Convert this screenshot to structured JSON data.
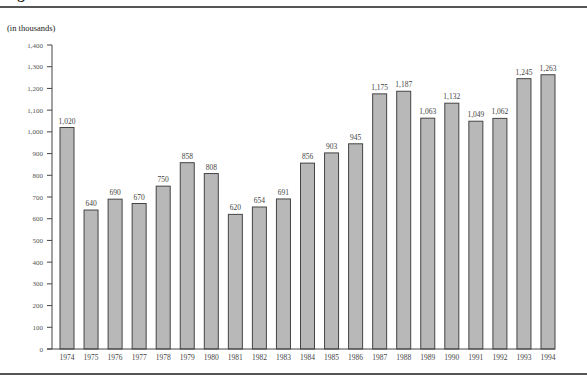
{
  "title": "Figure",
  "unit_label": "(in thousands)",
  "colors": {
    "bar_fill": "#b8b8b8",
    "bar_stroke": "#444444",
    "axis": "#444444",
    "rule": "#555555"
  },
  "chart_data": {
    "type": "bar",
    "title": "",
    "xlabel": "",
    "ylabel": "(in thousands)",
    "ylim": [
      0,
      1400
    ],
    "yticks": [
      0,
      100,
      200,
      300,
      400,
      500,
      600,
      700,
      800,
      900,
      1000,
      1100,
      1200,
      1300,
      1400
    ],
    "ytick_labels": [
      "0",
      "100",
      "200",
      "300",
      "400",
      "500",
      "600",
      "700",
      "800",
      "900",
      "1,000",
      "1,100",
      "1,200",
      "1,300",
      "1,400"
    ],
    "grid": false,
    "legend": null,
    "categories": [
      "1974",
      "1975",
      "1976",
      "1977",
      "1978",
      "1979",
      "1980",
      "1981",
      "1982",
      "1983",
      "1984",
      "1985",
      "1986",
      "1987",
      "1988",
      "1989",
      "1990",
      "1991",
      "1992",
      "1993",
      "1994"
    ],
    "values": [
      1020,
      640,
      690,
      670,
      750,
      858,
      808,
      620,
      654,
      691,
      856,
      903,
      945,
      1175,
      1187,
      1063,
      1132,
      1049,
      1062,
      1245,
      1263
    ],
    "value_labels": [
      "1,020",
      "640",
      "690",
      "670",
      "750",
      "858",
      "808",
      "620",
      "654",
      "691",
      "856",
      "903",
      "945",
      "1,175",
      "1,187",
      "1,063",
      "1,132",
      "1,049",
      "1,062",
      "1,245",
      "1,263"
    ]
  }
}
